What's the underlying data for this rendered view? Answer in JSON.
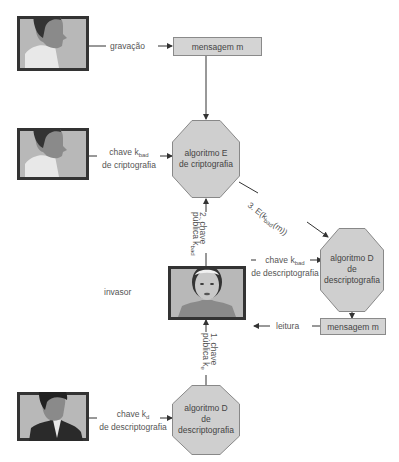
{
  "diagram": {
    "title": "",
    "nodes": {
      "sender_recording": {
        "label": "",
        "icon": "man-profile-icon"
      },
      "message_top": {
        "label": "mensagem m"
      },
      "sender_encrypt": {
        "label": "",
        "icon": "man-profile-icon"
      },
      "encrypt_algorithm": {
        "line1": "algoritmo E",
        "line2": "de criptografia"
      },
      "intruder": {
        "label": "invasor",
        "icon": "woman-portrait-icon"
      },
      "decrypt_algorithm_intruder": {
        "line1": "algoritmo D",
        "line2": "de",
        "line3": "descriptografia"
      },
      "message_bottom": {
        "label": "mensagem m"
      },
      "receiver": {
        "label": "",
        "icon": "man-suit-icon"
      },
      "decrypt_algorithm_receiver": {
        "line1": "algoritmo D",
        "line2": "de",
        "line3": "descriptografia"
      }
    },
    "edges": {
      "recording": {
        "label": "gravação"
      },
      "encrypt_key": {
        "line1_prefix": "chave k",
        "line1_sub": "bad",
        "line2": "de criptografia"
      },
      "step3": {
        "prefix": "3. E(k",
        "sub": "bad",
        "suffix": "(m))"
      },
      "step2": {
        "line1": "2. chave",
        "line2_prefix": "pública k",
        "line2_sub": "bad"
      },
      "intruder_decrypt_key": {
        "line1_prefix": "chave k",
        "line1_sub": "bad",
        "line2": "de descriptografia"
      },
      "reading": {
        "label": "leitura"
      },
      "step1": {
        "line1": "1. chave",
        "line2_prefix": "pública k",
        "line2_sub": "e"
      },
      "receiver_decrypt_key": {
        "line1_prefix": "chave k",
        "line1_sub": "d",
        "line2": "de descriptografia"
      }
    },
    "colors": {
      "box_fill": "#d4d4d4",
      "octagon_fill": "#cfcfcf",
      "line": "#333333",
      "frame": "#2e2e2e"
    }
  }
}
